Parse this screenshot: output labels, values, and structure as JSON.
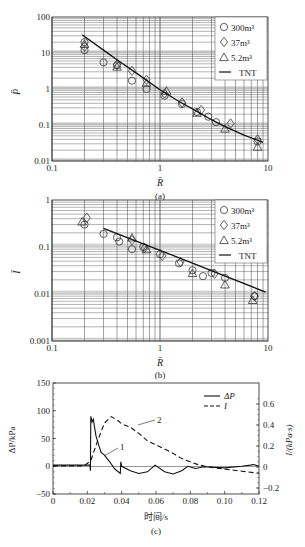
{
  "figure": {
    "panels": [
      "(a)",
      "(b)",
      "(c)"
    ]
  },
  "chart_data": [
    {
      "id": "a",
      "type": "scatter",
      "caption": "(a)",
      "xlabel": "R̄",
      "ylabel": "P̄",
      "xscale": "log",
      "yscale": "log",
      "xlim": [
        0.1,
        10
      ],
      "ylim": [
        0.01,
        100
      ],
      "xticks": [
        "0.1",
        "1",
        "10"
      ],
      "yticks": [
        "0.01",
        "0.1",
        "1",
        "10",
        "100"
      ],
      "grid": true,
      "legend": {
        "position": "upper right",
        "entries": [
          "300m³",
          "37m³",
          "5.2m³",
          "TNT"
        ]
      },
      "series": [
        {
          "name": "300m³",
          "marker": "circle",
          "points": [
            [
              0.2,
              20
            ],
            [
              0.2,
              12
            ],
            [
              0.3,
              5.5
            ],
            [
              0.4,
              4.5
            ],
            [
              0.55,
              1.7
            ],
            [
              0.75,
              1.0
            ],
            [
              1.1,
              0.65
            ],
            [
              1.6,
              0.38
            ],
            [
              2.2,
              0.23
            ],
            [
              2.8,
              0.17
            ],
            [
              3.3,
              0.12
            ],
            [
              8.0,
              0.035
            ]
          ]
        },
        {
          "name": "37m³",
          "marker": "diamond",
          "points": [
            [
              0.2,
              15
            ],
            [
              0.4,
              4.8
            ],
            [
              0.55,
              3.2
            ],
            [
              0.75,
              1.8
            ],
            [
              1.1,
              0.75
            ],
            [
              1.6,
              0.42
            ],
            [
              2.4,
              0.26
            ],
            [
              4.5,
              0.11
            ],
            [
              8.0,
              0.04
            ]
          ]
        },
        {
          "name": "5.2m³",
          "marker": "triangle",
          "points": [
            [
              0.2,
              18
            ],
            [
              0.4,
              4.2
            ],
            [
              0.75,
              1.5
            ],
            [
              1.15,
              0.9
            ],
            [
              2.2,
              0.22
            ],
            [
              4.0,
              0.08
            ],
            [
              8.0,
              0.025
            ]
          ]
        },
        {
          "name": "TNT",
          "marker": "line",
          "points": [
            [
              0.19,
              32
            ],
            [
              0.3,
              12
            ],
            [
              0.4,
              6.5
            ],
            [
              0.6,
              2.8
            ],
            [
              1.0,
              0.95
            ],
            [
              1.5,
              0.45
            ],
            [
              2.0,
              0.28
            ],
            [
              3.0,
              0.14
            ],
            [
              4.0,
              0.09
            ],
            [
              6.0,
              0.052
            ],
            [
              9.0,
              0.033
            ]
          ]
        }
      ]
    },
    {
      "id": "b",
      "type": "scatter",
      "caption": "(b)",
      "xlabel": "R̄",
      "ylabel": "Ī",
      "xscale": "log",
      "yscale": "log",
      "xlim": [
        0.1,
        10
      ],
      "ylim": [
        0.001,
        1
      ],
      "xticks": [
        "0.1",
        "1",
        "10"
      ],
      "yticks": [
        "0.001",
        "0.01",
        "0.1",
        "1"
      ],
      "grid": true,
      "legend": {
        "position": "upper right",
        "entries": [
          "300m³",
          "37m³",
          "5.2m³",
          "TNT"
        ]
      },
      "series": [
        {
          "name": "300m³",
          "marker": "circle",
          "points": [
            [
              0.2,
              0.3
            ],
            [
              0.3,
              0.19
            ],
            [
              0.4,
              0.16
            ],
            [
              0.42,
              0.13
            ],
            [
              0.55,
              0.09
            ],
            [
              0.7,
              0.1
            ],
            [
              1.0,
              0.07
            ],
            [
              1.5,
              0.045
            ],
            [
              2.0,
              0.032
            ],
            [
              2.5,
              0.024
            ],
            [
              3.0,
              0.028
            ],
            [
              4.0,
              0.022
            ],
            [
              7.5,
              0.009
            ]
          ]
        },
        {
          "name": "37m³",
          "marker": "diamond",
          "points": [
            [
              0.21,
              0.42
            ],
            [
              0.55,
              0.14
            ],
            [
              0.72,
              0.095
            ],
            [
              1.05,
              0.065
            ],
            [
              1.55,
              0.048
            ],
            [
              3.2,
              0.027
            ],
            [
              7.5,
              0.009
            ]
          ]
        },
        {
          "name": "5.2m³",
          "marker": "triangle",
          "points": [
            [
              0.19,
              0.35
            ],
            [
              0.55,
              0.16
            ],
            [
              0.75,
              0.09
            ],
            [
              2.0,
              0.028
            ],
            [
              4.0,
              0.016
            ],
            [
              7.2,
              0.0075
            ]
          ]
        },
        {
          "name": "TNT",
          "marker": "line",
          "points": [
            [
              0.3,
              0.25
            ],
            [
              1.0,
              0.085
            ],
            [
              9.5,
              0.011
            ]
          ]
        }
      ]
    },
    {
      "id": "c",
      "type": "line",
      "caption": "(c)",
      "xlabel": "时间/s",
      "ylabel": "ΔP/kPa",
      "ylabel_right": "I/(kPa·s)",
      "xlim": [
        0,
        0.12
      ],
      "ylim": [
        -50,
        150
      ],
      "ylim_right": [
        -0.2,
        0.7
      ],
      "xticks": [
        "0",
        "0.02",
        "0.04",
        "0.06",
        "0.08",
        "0.10",
        "0.12"
      ],
      "yticks": [
        "-50",
        "0",
        "50",
        "100",
        "150"
      ],
      "yticks_right": [
        "-0.2",
        "0",
        "0.2",
        "0.4",
        "0.6"
      ],
      "grid": false,
      "legend": {
        "position": "upper right",
        "entries": [
          "ΔP",
          "I"
        ]
      },
      "annotations": [
        "1",
        "2"
      ],
      "series": [
        {
          "name": "ΔP",
          "axis": "left",
          "style": "solid",
          "points": [
            [
              0,
              2
            ],
            [
              0.02,
              2
            ],
            [
              0.0215,
              2
            ],
            [
              0.0218,
              -8
            ],
            [
              0.022,
              90
            ],
            [
              0.0228,
              80
            ],
            [
              0.0235,
              85
            ],
            [
              0.025,
              55
            ],
            [
              0.027,
              35
            ],
            [
              0.028,
              25
            ],
            [
              0.03,
              20
            ],
            [
              0.033,
              8
            ],
            [
              0.036,
              -5
            ],
            [
              0.0392,
              -13
            ],
            [
              0.0395,
              8
            ],
            [
              0.04,
              0
            ],
            [
              0.045,
              -8
            ],
            [
              0.05,
              -13
            ],
            [
              0.055,
              -10
            ],
            [
              0.0595,
              2
            ],
            [
              0.065,
              -10
            ],
            [
              0.07,
              -14
            ],
            [
              0.075,
              -8
            ],
            [
              0.0785,
              0
            ],
            [
              0.083,
              -4
            ],
            [
              0.088,
              -1
            ],
            [
              0.1,
              -3
            ],
            [
              0.11,
              0
            ],
            [
              0.117,
              3
            ],
            [
              0.12,
              0
            ]
          ]
        },
        {
          "name": "I",
          "axis": "right",
          "style": "dashed",
          "points": [
            [
              0,
              0.01
            ],
            [
              0.018,
              0.01
            ],
            [
              0.022,
              0.06
            ],
            [
              0.026,
              0.25
            ],
            [
              0.03,
              0.42
            ],
            [
              0.034,
              0.48
            ],
            [
              0.038,
              0.44
            ],
            [
              0.04,
              0.41
            ],
            [
              0.045,
              0.38
            ],
            [
              0.05,
              0.32
            ],
            [
              0.055,
              0.25
            ],
            [
              0.06,
              0.21
            ],
            [
              0.065,
              0.17
            ],
            [
              0.07,
              0.13
            ],
            [
              0.075,
              0.08
            ],
            [
              0.08,
              0.05
            ],
            [
              0.085,
              0.02
            ],
            [
              0.09,
              0.0
            ],
            [
              0.1,
              -0.02
            ],
            [
              0.11,
              -0.04
            ],
            [
              0.12,
              -0.06
            ]
          ]
        }
      ]
    }
  ]
}
